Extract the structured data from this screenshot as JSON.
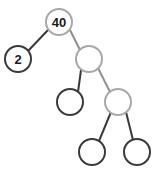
{
  "figure": {
    "background_color": "#ffffff",
    "width": 153,
    "height": 174
  },
  "style": {
    "node_fill": "#ffffff",
    "node_stroke_dark": "#3a3a3a",
    "node_stroke_light": "#a8a8a8",
    "edge_color_dark": "#3a3a3a",
    "edge_color_light": "#8f8f8f",
    "node_radius": 13,
    "node_stroke_width": 2,
    "edge_stroke_width": 2,
    "label_color": "#1a1a1a"
  },
  "tree": {
    "nodes": [
      {
        "id": "root",
        "label": "40",
        "cx": 59,
        "cy": 22,
        "r": 13,
        "stroke": "#a8a8a8",
        "labeled": true
      },
      {
        "id": "left",
        "label": "2",
        "cx": 18,
        "cy": 59,
        "r": 13,
        "stroke": "#3a3a3a",
        "labeled": true
      },
      {
        "id": "right",
        "label": "",
        "cx": 89,
        "cy": 59,
        "r": 13,
        "stroke": "#a8a8a8",
        "labeled": false
      },
      {
        "id": "right-left",
        "label": "",
        "cx": 70,
        "cy": 102,
        "r": 13,
        "stroke": "#3a3a3a",
        "labeled": false
      },
      {
        "id": "right-right",
        "label": "",
        "cx": 118,
        "cy": 102,
        "r": 13,
        "stroke": "#a8a8a8",
        "labeled": false
      },
      {
        "id": "leaf-left",
        "label": "",
        "cx": 92,
        "cy": 152,
        "r": 13,
        "stroke": "#3a3a3a",
        "labeled": false
      },
      {
        "id": "leaf-right",
        "label": "",
        "cx": 137,
        "cy": 152,
        "r": 13,
        "stroke": "#3a3a3a",
        "labeled": false
      }
    ],
    "edges": [
      {
        "id": "root-to-left",
        "from": "root",
        "to": "left",
        "x1": 48,
        "y1": 30,
        "x2": 28,
        "y2": 51,
        "color": "#3a3a3a"
      },
      {
        "id": "root-to-right",
        "from": "root",
        "to": "right",
        "x1": 70,
        "y1": 30,
        "x2": 80,
        "y2": 50,
        "color": "#8f8f8f"
      },
      {
        "id": "right-to-right-left",
        "from": "right",
        "to": "right-left",
        "x1": 81,
        "y1": 70,
        "x2": 78,
        "y2": 92,
        "color": "#3a3a3a"
      },
      {
        "id": "right-to-right-right",
        "from": "right",
        "to": "right-right",
        "x1": 98,
        "y1": 68,
        "x2": 110,
        "y2": 92,
        "color": "#8f8f8f"
      },
      {
        "id": "right-right-to-leaf-left",
        "from": "right-right",
        "to": "leaf-left",
        "x1": 111,
        "y1": 112,
        "x2": 99,
        "y2": 141,
        "color": "#3a3a3a"
      },
      {
        "id": "right-right-to-leaf-right",
        "from": "right-right",
        "to": "leaf-right",
        "x1": 126,
        "y1": 112,
        "x2": 133,
        "y2": 140,
        "color": "#3a3a3a"
      }
    ],
    "node_count": 7,
    "labeled_values": [
      "40",
      "2"
    ]
  }
}
